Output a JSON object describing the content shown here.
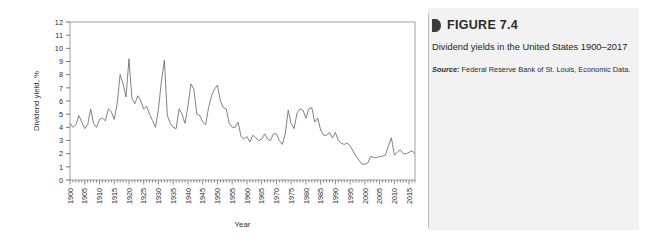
{
  "figure": {
    "marker_icon": "figure-marker-icon",
    "title": "FIGURE 7.4",
    "description": "Dividend yields in the United States 1900–2017",
    "source_label": "Source:",
    "source_text": " Federal Reserve Bank of St. Louis, Economic Data."
  },
  "chart_data": {
    "type": "line",
    "title": "",
    "xlabel": "Year",
    "ylabel": "Dividend yield, %",
    "xlim": [
      1900,
      2017
    ],
    "ylim": [
      0,
      12
    ],
    "ytick_step": 1,
    "xtick_step": 5,
    "grid": false,
    "legend": null,
    "line_color": "#6b6b6b",
    "ytick_labels": [
      "0",
      "1",
      "2",
      "3",
      "4",
      "5",
      "6",
      "7",
      "8",
      "9",
      "10",
      "11",
      "12"
    ],
    "xtick_labels": [
      "1900",
      "1905",
      "1910",
      "1915",
      "1920",
      "1925",
      "1930",
      "1935",
      "1940",
      "1945",
      "1950",
      "1955",
      "1960",
      "1965",
      "1970",
      "1975",
      "1980",
      "1985",
      "1990",
      "1995",
      "2000",
      "2005",
      "2010",
      "2015"
    ],
    "x": [
      1900,
      1901,
      1902,
      1903,
      1904,
      1905,
      1906,
      1907,
      1908,
      1909,
      1910,
      1911,
      1912,
      1913,
      1914,
      1915,
      1916,
      1917,
      1918,
      1919,
      1920,
      1921,
      1922,
      1923,
      1924,
      1925,
      1926,
      1927,
      1928,
      1929,
      1930,
      1931,
      1932,
      1933,
      1934,
      1935,
      1936,
      1937,
      1938,
      1939,
      1940,
      1941,
      1942,
      1943,
      1944,
      1945,
      1946,
      1947,
      1948,
      1949,
      1950,
      1951,
      1952,
      1953,
      1954,
      1955,
      1956,
      1957,
      1958,
      1959,
      1960,
      1961,
      1962,
      1963,
      1964,
      1965,
      1966,
      1967,
      1968,
      1969,
      1970,
      1971,
      1972,
      1973,
      1974,
      1975,
      1976,
      1977,
      1978,
      1979,
      1980,
      1981,
      1982,
      1983,
      1984,
      1985,
      1986,
      1987,
      1988,
      1989,
      1990,
      1991,
      1992,
      1993,
      1994,
      1995,
      1996,
      1997,
      1998,
      1999,
      2000,
      2001,
      2002,
      2003,
      2004,
      2005,
      2006,
      2007,
      2008,
      2009,
      2010,
      2011,
      2012,
      2013,
      2014,
      2015,
      2016,
      2017
    ],
    "values": [
      4.3,
      4.0,
      4.2,
      4.9,
      4.4,
      3.9,
      4.2,
      5.4,
      4.3,
      4.0,
      4.6,
      4.7,
      4.5,
      5.4,
      5.2,
      4.6,
      5.8,
      8.0,
      7.3,
      6.3,
      9.2,
      6.2,
      5.8,
      6.4,
      6.0,
      5.4,
      5.6,
      5.0,
      4.5,
      4.0,
      5.4,
      7.5,
      9.1,
      4.9,
      4.3,
      4.0,
      3.9,
      5.4,
      5.0,
      4.3,
      5.6,
      7.3,
      6.9,
      5.0,
      4.9,
      4.4,
      4.2,
      5.5,
      6.4,
      6.9,
      7.2,
      6.0,
      5.5,
      5.4,
      4.3,
      4.0,
      4.0,
      4.4,
      3.3,
      3.1,
      3.3,
      2.9,
      3.4,
      3.2,
      3.0,
      3.1,
      3.5,
      3.1,
      3.0,
      3.5,
      3.5,
      3.0,
      2.7,
      3.5,
      5.3,
      4.3,
      3.9,
      5.1,
      5.4,
      5.3,
      4.7,
      5.4,
      5.5,
      4.4,
      4.7,
      3.8,
      3.4,
      3.4,
      3.6,
      3.2,
      3.6,
      3.0,
      2.8,
      2.7,
      2.8,
      2.6,
      2.2,
      1.8,
      1.5,
      1.2,
      1.2,
      1.3,
      1.8,
      1.7,
      1.7,
      1.8,
      1.8,
      1.9,
      2.6,
      3.2,
      1.9,
      2.1,
      2.3,
      2.0,
      2.0,
      2.1,
      2.2,
      2.0
    ]
  }
}
